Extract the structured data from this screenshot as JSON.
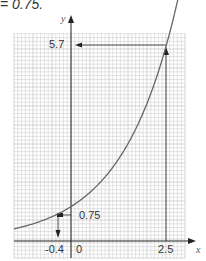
{
  "caption": "= 0.75.",
  "chart_data": {
    "type": "line",
    "title": "",
    "function": "y = 2^x",
    "xlabel": "x",
    "ylabel": "y",
    "xlim": [
      -1.5,
      3.0
    ],
    "ylim": [
      -0.5,
      6.0
    ],
    "grid": true,
    "series": [
      {
        "name": "curve",
        "x": [
          -1.5,
          -1.0,
          -0.4,
          0,
          0.5,
          1.0,
          1.5,
          2.0,
          2.5,
          2.8
        ],
        "y": [
          0.35,
          0.5,
          0.75,
          1.0,
          1.41,
          2.0,
          2.83,
          4.0,
          5.66,
          6.96
        ]
      }
    ],
    "annotations": [
      {
        "text": "5.7",
        "type": "y-reading",
        "from_x": 2.5,
        "y": 5.7
      },
      {
        "text": "2.5",
        "type": "x-tick",
        "x": 2.5
      },
      {
        "text": "0.75",
        "type": "y-reading",
        "y": 0.75
      },
      {
        "text": "-0.4",
        "type": "x-reading",
        "x": -0.4
      },
      {
        "text": "0",
        "type": "origin"
      }
    ]
  },
  "labels": {
    "y57": "5.7",
    "y075": "0.75",
    "xneg04": "-0.4",
    "x0": "0",
    "x25": "2.5",
    "xaxis": "x",
    "yaxis": "y"
  },
  "colors": {
    "grid": "#c8c8c8",
    "grid_major": "#a8a8a8",
    "axis": "#222222",
    "curve": "#666666"
  }
}
